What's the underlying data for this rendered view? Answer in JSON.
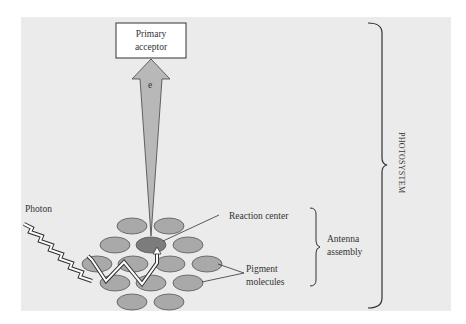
{
  "diagram": {
    "title": "Photosystem",
    "background_color": "#ebebeb",
    "labels": {
      "primary_acceptor_line1": "Primary",
      "primary_acceptor_line2": "acceptor",
      "electron": "e",
      "photon": "Photon",
      "reaction_center": "Reaction center",
      "antenna_line1": "Antenna",
      "antenna_line2": "assembly",
      "pigment_line1": "Pigment",
      "pigment_line2": "molecules",
      "photosystem": "PHOTOSYSTEM"
    },
    "colors": {
      "pigment": "#a9a9a9",
      "reaction_center": "#7c7c7c",
      "arrow": "#b8b8b8",
      "stroke": "#333333"
    },
    "pigment_molecule_count": 15
  }
}
